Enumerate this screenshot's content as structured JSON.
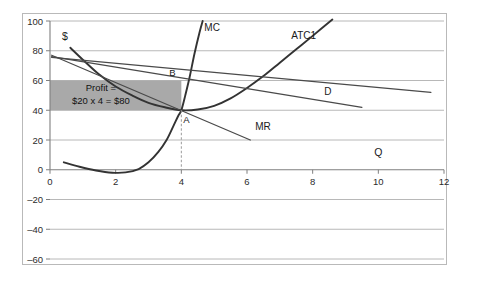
{
  "chart_data": {
    "type": "line",
    "title": "",
    "xlabel": "Q",
    "ylabel": "$",
    "xlim": [
      0,
      12
    ],
    "ylim": [
      -60,
      100
    ],
    "grid": true,
    "legend": "inline-labels",
    "xticks": [
      "0",
      "2",
      "4",
      "6",
      "8",
      "10",
      "12"
    ],
    "yticks": [
      "100",
      "80",
      "60",
      "40",
      "20",
      "0",
      "–20",
      "–40",
      "–60"
    ],
    "series": [
      {
        "name": "MC",
        "label": "MC",
        "type": "curve",
        "label_x": 4.7,
        "label_y": 93,
        "points": [
          [
            0.42,
            5
          ],
          [
            0.9,
            2
          ],
          [
            1.4,
            -0.5
          ],
          [
            1.9,
            -2
          ],
          [
            2.3,
            -1.8
          ],
          [
            2.7,
            0.5
          ],
          [
            3.0,
            5
          ],
          [
            3.3,
            12
          ],
          [
            3.55,
            20
          ],
          [
            3.75,
            29
          ],
          [
            3.9,
            36
          ],
          [
            4.0,
            40
          ],
          [
            4.12,
            50
          ],
          [
            4.25,
            62
          ],
          [
            4.4,
            78
          ],
          [
            4.55,
            92
          ],
          [
            4.65,
            100
          ]
        ]
      },
      {
        "name": "ATC1",
        "label": "ATC1",
        "type": "curve",
        "label_x": 7.35,
        "label_y": 88,
        "points": [
          [
            0.62,
            82
          ],
          [
            1.0,
            74
          ],
          [
            1.5,
            64
          ],
          [
            2.0,
            56
          ],
          [
            2.5,
            50
          ],
          [
            3.0,
            45
          ],
          [
            3.5,
            42
          ],
          [
            4.0,
            40
          ],
          [
            4.5,
            40.5
          ],
          [
            5.0,
            43
          ],
          [
            5.5,
            48
          ],
          [
            6.0,
            55
          ],
          [
            6.5,
            63
          ],
          [
            7.0,
            72
          ],
          [
            7.5,
            81
          ],
          [
            8.0,
            90
          ],
          [
            8.6,
            101
          ]
        ]
      },
      {
        "name": "D",
        "label": "D",
        "type": "line",
        "label_x": 8.35,
        "label_y": 50,
        "points": [
          [
            0.05,
            76
          ],
          [
            9.5,
            42
          ]
        ]
      },
      {
        "name": "MR",
        "label": "MR",
        "type": "line",
        "label_x": 6.25,
        "label_y": 27,
        "points": [
          [
            0.05,
            77
          ],
          [
            6.1,
            20
          ]
        ]
      },
      {
        "name": "price-line",
        "label": "",
        "type": "line",
        "points": [
          [
            0.05,
            75.5
          ],
          [
            11.6,
            52
          ]
        ]
      }
    ],
    "points": [
      {
        "name": "B",
        "label": "B",
        "x": 4,
        "y": 60,
        "label_dx": -9,
        "label_dy": -5
      },
      {
        "name": "A",
        "label": "A",
        "x": 4,
        "y": 40,
        "label_dx": 5,
        "label_dy": 13
      }
    ],
    "dashed_lines": [
      {
        "name": "quantity-dropline",
        "x": 4,
        "y_from": 40,
        "y_to": 0
      }
    ],
    "shaded_regions": [
      {
        "name": "profit-rectangle",
        "x_from": 0,
        "x_to": 4,
        "y_from": 40,
        "y_to": 60,
        "color": "#a9a9a9"
      }
    ],
    "annotations": [
      {
        "name": "profit-annotation",
        "line1": "Profit =",
        "line2": "$20 x 4 = $80",
        "x": 1.55,
        "y": 53
      }
    ],
    "colors": {
      "axis": "#7f7f7f",
      "grid": "#b0b0b0",
      "curve_dark": "#333333",
      "curve_medium": "#4a4a4a",
      "shade": "#a9a9a9",
      "frame": "#b9b9b9",
      "background": "#ffffff"
    }
  }
}
